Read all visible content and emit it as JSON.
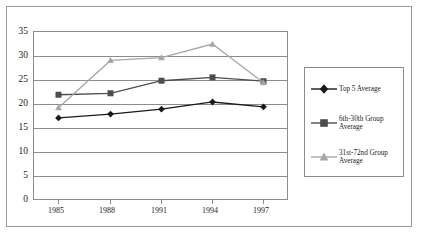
{
  "chart_data": {
    "type": "line",
    "title": "",
    "xlabel": "",
    "ylabel": "",
    "categories": [
      "1985",
      "1988",
      "1991",
      "1994",
      "1997"
    ],
    "x": [
      1985,
      1988,
      1991,
      1994,
      1997
    ],
    "ylim": [
      0,
      35
    ],
    "yticks": [
      0,
      5,
      10,
      15,
      20,
      25,
      30,
      35
    ],
    "ytick_labels": [
      "0",
      "5",
      "10",
      "15",
      "20",
      "25",
      "30",
      "35"
    ],
    "xtick_labels": [
      "1985",
      "1988",
      "1991",
      "1994",
      "1997"
    ],
    "grid": "horizontal",
    "legend_position": "right",
    "series": [
      {
        "name": "Top 5 Average",
        "values": [
          17.0,
          17.8,
          18.8,
          20.3,
          19.3
        ],
        "color": "#1a1a1a",
        "marker": "diamond"
      },
      {
        "name": "6th-30th Group Average",
        "values": [
          21.8,
          22.1,
          24.7,
          25.4,
          24.6
        ],
        "color": "#4d4d4d",
        "marker": "square"
      },
      {
        "name": "31st-72nd Group Average",
        "values": [
          19.1,
          28.9,
          29.5,
          32.3,
          24.3
        ],
        "color": "#a6a6a6",
        "marker": "triangle"
      }
    ]
  },
  "axes": {
    "y_labels": [
      "35",
      "30",
      "25",
      "20",
      "15",
      "10",
      "5",
      "0"
    ],
    "x_labels": [
      "1985",
      "1988",
      "1991",
      "1994",
      "1997"
    ]
  },
  "legend": {
    "items": [
      {
        "label": "Top 5 Average",
        "marker": "diamond",
        "color": "#1a1a1a"
      },
      {
        "label": "6th-30th Group\nAverage",
        "marker": "square",
        "color": "#4d4d4d"
      },
      {
        "label": "31st-72nd Group\nAverage",
        "marker": "triangle",
        "color": "#a6a6a6"
      }
    ]
  },
  "colors": {
    "frame": "#9a9a9a",
    "axis": "#8c8c8c",
    "text": "#1b1b1b",
    "background": "#ffffff"
  }
}
